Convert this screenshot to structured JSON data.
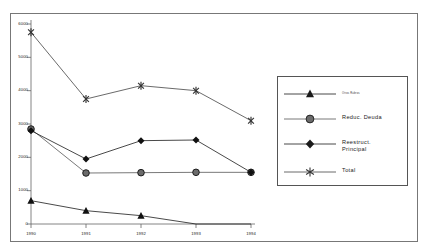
{
  "chart_data": {
    "type": "line",
    "title": "",
    "subtitle": "",
    "xlabel": "",
    "ylabel": "",
    "categories": [
      "1990",
      "1991",
      "1992",
      "1993",
      "1994"
    ],
    "x_tick_labels": [
      "1990",
      "1991",
      "1992",
      "1993",
      "1994"
    ],
    "y_tick_labels": [
      "6000",
      "5000",
      "4000",
      "3000",
      "2000",
      "1000",
      "0"
    ],
    "y_ticks": [
      6000,
      5000,
      4000,
      3000,
      2000,
      1000,
      0
    ],
    "ylim": [
      0,
      6000
    ],
    "grid": false,
    "legend_position": "right",
    "series": [
      {
        "name": "Otros Rubros",
        "legend_label": "Otros Rubros",
        "marker": "triangle",
        "color": "#1a1a1a",
        "values": [
          700,
          400,
          250,
          0,
          0
        ]
      },
      {
        "name": "Reduc. Deuda",
        "legend_label": "Reduc. Deuda",
        "marker": "circle",
        "color": "#555555",
        "values": [
          2850,
          1530,
          1540,
          1550,
          1550
        ]
      },
      {
        "name": "Reestruct. Principal",
        "legend_label": "Reestruct.\nPrincipal",
        "marker": "diamond",
        "color": "#1a1a1a",
        "values": [
          2800,
          1950,
          2500,
          2520,
          1550
        ]
      },
      {
        "name": "Total",
        "legend_label": "Total",
        "marker": "asterisk",
        "color": "#444444",
        "values": [
          5750,
          3750,
          4150,
          4000,
          3100
        ]
      }
    ]
  },
  "legend": {
    "entries": [
      {
        "label": "Otros Rubros",
        "marker": "triangle"
      },
      {
        "label": "Reduc. Deuda",
        "marker": "circle"
      },
      {
        "label": "Reestruct.\nPrincipal",
        "marker": "diamond"
      },
      {
        "label": "Total",
        "marker": "asterisk"
      }
    ]
  },
  "axes": {
    "y_labels": [
      "6000",
      "5000",
      "4000",
      "3000",
      "2000",
      "1000",
      "0"
    ],
    "x_labels": [
      "1990",
      "1991",
      "1992",
      "1993",
      "1994"
    ]
  }
}
